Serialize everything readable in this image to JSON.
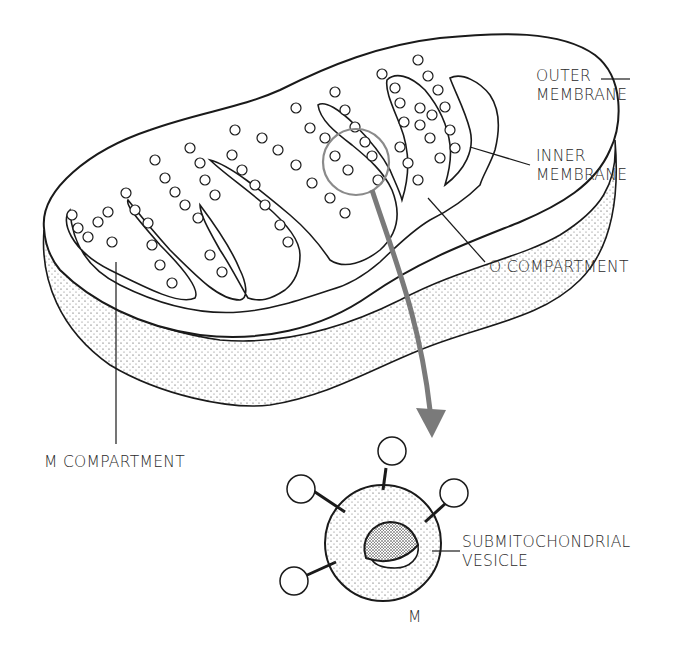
{
  "figure": {
    "labels": {
      "outer_membrane": [
        "OUTER",
        "MEMBRANE"
      ],
      "inner_membrane": [
        "INNER",
        "MEMBRANE"
      ],
      "o_compartment": "O COMPARTMENT",
      "m_compartment": "M COMPARTMENT",
      "submitochondrial_vesicle": [
        "SUBMITOCHONDRIAL",
        "VESICLE"
      ],
      "vesicle_interior": "M"
    },
    "colors": {
      "line": "#1a1a1a",
      "arrow": "#7a7a7a",
      "highlight_circle": "#8a8a8a",
      "background": "#ffffff"
    }
  }
}
